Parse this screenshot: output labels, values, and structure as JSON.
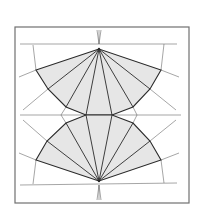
{
  "diagram": {
    "type": "geometric-fan-figure",
    "colors": {
      "background": "#ffffff",
      "frame": "#707070",
      "fill": "#e6e6e6",
      "thick_line": "#2a2a2a",
      "thin_line": "#6a6a6a"
    },
    "frame": {
      "x": 15,
      "y": 27,
      "width": 174,
      "height": 176
    },
    "top_apex": [
      99,
      49
    ],
    "bottom_apex": [
      99,
      181
    ],
    "upper_fan_points": [
      [
        36,
        70
      ],
      [
        48,
        89
      ],
      [
        66,
        107
      ],
      [
        86,
        115
      ],
      [
        112,
        115
      ],
      [
        133,
        107
      ],
      [
        150,
        89
      ],
      [
        161,
        70
      ]
    ],
    "lower_fan_points": [
      [
        36,
        160
      ],
      [
        47,
        141
      ],
      [
        66,
        123
      ],
      [
        86,
        115
      ],
      [
        112,
        115
      ],
      [
        133,
        123
      ],
      [
        150,
        141
      ],
      [
        161,
        160
      ]
    ]
  }
}
